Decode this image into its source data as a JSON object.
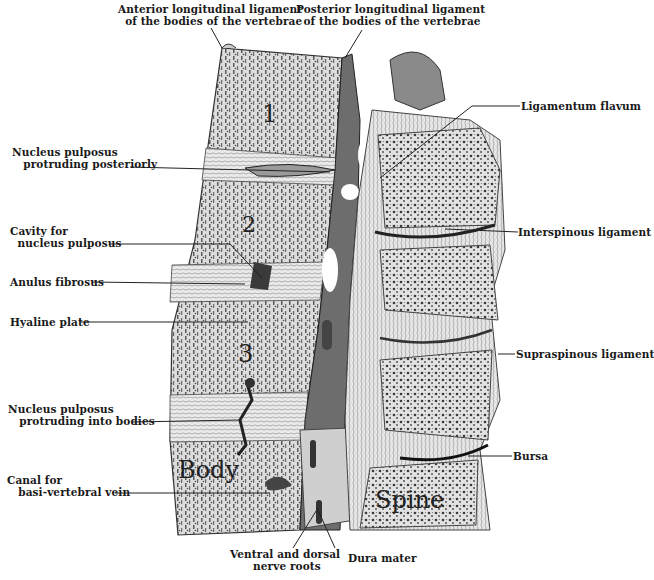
{
  "figure": {
    "region_labels": {
      "vertebra_1": "1",
      "vertebra_2": "2",
      "vertebra_3": "3",
      "body": "Body",
      "spine": "Spine"
    },
    "labels": {
      "anterior_ligament": "Anterior longitudinal ligament\n of the bodies of the vertebrae",
      "posterior_ligament": "Posterior longitudinal ligament\n  of the bodies of the vertebrae",
      "nucleus_posteriorly": "Nucleus pulposus\n   protruding posteriorly",
      "cavity": "Cavity for\n  nucleus pulposus",
      "anulus": "Anulus fibrosus",
      "hyaline": "Hyaline plate",
      "nucleus_bodies": "Nucleus pulposus\n   protruding into bodies",
      "canal": "Canal for\n   basi-vertebral vein",
      "ligamentum_flavum": "Ligamentum flavum",
      "interspinous": "Interspinous ligament",
      "supraspinous": "Supraspinous ligament",
      "bursa": "Bursa",
      "nerve_roots": "Ventral and dorsal\n nerve roots",
      "dura_mater": "Dura mater"
    },
    "colors": {
      "ink": "#1a1a1a",
      "bone": "#d9d9d9",
      "dark": "#555555",
      "paper": "#ffffff"
    }
  }
}
